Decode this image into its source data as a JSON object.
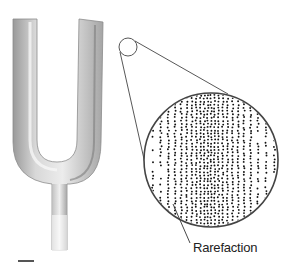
{
  "figure": {
    "label": "Rarefaction",
    "magnifier": {
      "small_circle": {
        "cx": 128,
        "cy": 47,
        "r": 9
      },
      "large_circle": {
        "cx": 211,
        "cy": 160,
        "r": 67
      }
    },
    "colors": {
      "fork_light": "#e6e6e6",
      "fork_mid": "#bdbdbd",
      "fork_dark": "#8a8a8a",
      "outline": "#444444",
      "dots": "#111111"
    }
  }
}
